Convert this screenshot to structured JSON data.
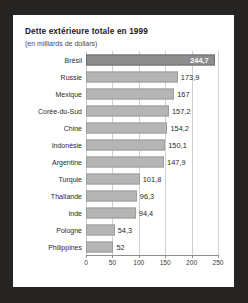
{
  "chart_data": {
    "type": "bar",
    "orientation": "horizontal",
    "title": "Dette extérieure totale en 1999",
    "subtitle": "(en milliards de dollars)",
    "xlabel": "",
    "ylabel": "",
    "xlim": [
      0,
      250
    ],
    "grid": true,
    "legend": "none",
    "xticks": [
      "0",
      "50",
      "100",
      "150",
      "200",
      "250"
    ],
    "xtick_values": [
      0,
      50,
      100,
      150,
      200,
      250
    ],
    "categories": [
      "Brésil",
      "Russie",
      "Mexique",
      "Corée-du-Sud",
      "Chine",
      "Indonésie",
      "Argentine",
      "Turquie",
      "Thaïlande",
      "Inde",
      "Pologne",
      "Philippines"
    ],
    "values": [
      244.7,
      173.9,
      167,
      157.2,
      154.2,
      150.1,
      147.9,
      101.8,
      96.3,
      94.4,
      54.3,
      52
    ],
    "value_labels": [
      "244,7",
      "173,9",
      "167",
      "157,2",
      "154,2",
      "150,1",
      "147,9",
      "101,8",
      "96,3",
      "94,4",
      "54,3",
      "52"
    ],
    "highlight_index": 0,
    "colors": {
      "bar": "#b5b5b5",
      "bar_highlight": "#8d8d8d",
      "background": "#ffffff",
      "page_background": "#262423",
      "grid": "#cfcfcf",
      "axis": "#8f8f8f",
      "text": "#2a2a2a",
      "highlight_text": "#ffffff"
    }
  }
}
